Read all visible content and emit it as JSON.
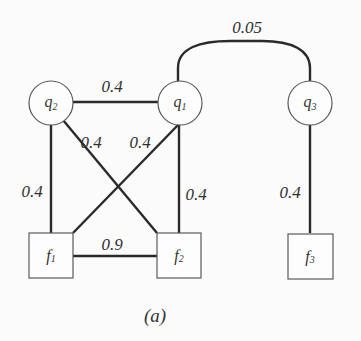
{
  "diagram": {
    "caption": "(a)",
    "colors": {
      "background": "#fbfbfb",
      "edge": "#2a2a2a",
      "node_stroke": "#5a5a5a",
      "text": "#333333"
    },
    "nodes": [
      {
        "id": "q2",
        "kind": "variable",
        "shape": "circle",
        "base": "q",
        "sub": "2"
      },
      {
        "id": "q1",
        "kind": "variable",
        "shape": "circle",
        "base": "q",
        "sub": "1"
      },
      {
        "id": "q3",
        "kind": "variable",
        "shape": "circle",
        "base": "q",
        "sub": "3"
      },
      {
        "id": "f1",
        "kind": "factor",
        "shape": "square",
        "base": "f",
        "sub": "1"
      },
      {
        "id": "f2",
        "kind": "factor",
        "shape": "square",
        "base": "f",
        "sub": "2"
      },
      {
        "id": "f3",
        "kind": "factor",
        "shape": "square",
        "base": "f",
        "sub": "3"
      }
    ],
    "edges": [
      {
        "from": "q2",
        "to": "q1",
        "weight": "0.4"
      },
      {
        "from": "q1",
        "to": "q3",
        "weight": "0.05",
        "style": "arc"
      },
      {
        "from": "q2",
        "to": "f1",
        "weight": "0.4"
      },
      {
        "from": "q2",
        "to": "f2",
        "weight": "0.4"
      },
      {
        "from": "q1",
        "to": "f1",
        "weight": "0.4"
      },
      {
        "from": "q1",
        "to": "f2",
        "weight": "0.4"
      },
      {
        "from": "f1",
        "to": "f2",
        "weight": "0.9"
      },
      {
        "from": "q3",
        "to": "f3",
        "weight": "0.4"
      }
    ]
  }
}
